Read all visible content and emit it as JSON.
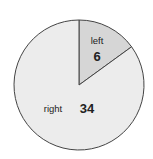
{
  "chart_data": {
    "type": "pie",
    "title": "",
    "categories": [
      "left",
      "right"
    ],
    "values": [
      6,
      34
    ],
    "colors": [
      "#d6d6d6",
      "#ececec"
    ],
    "start_angle_deg": 0,
    "direction": "clockwise",
    "stroke_color": "#444444",
    "legend": "none",
    "labels_inside": true
  },
  "slices": [
    {
      "label": "left",
      "value": "6"
    },
    {
      "label": "right",
      "value": "34"
    }
  ]
}
